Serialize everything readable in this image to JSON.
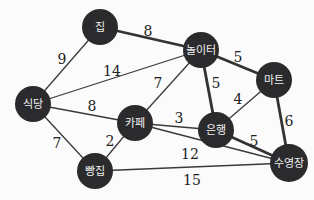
{
  "graph": {
    "nodes": [
      {
        "id": "home",
        "label": "집",
        "x": 100,
        "y": 27,
        "r": 18
      },
      {
        "id": "playground",
        "label": "놀이터",
        "x": 201,
        "y": 50,
        "r": 18
      },
      {
        "id": "mart",
        "label": "마트",
        "x": 274,
        "y": 80,
        "r": 18
      },
      {
        "id": "restaurant",
        "label": "식당",
        "x": 33,
        "y": 104,
        "r": 18
      },
      {
        "id": "cafe",
        "label": "카페",
        "x": 135,
        "y": 123,
        "r": 18
      },
      {
        "id": "bank",
        "label": "은행",
        "x": 216,
        "y": 130,
        "r": 18
      },
      {
        "id": "pool",
        "label": "수영장",
        "x": 289,
        "y": 163,
        "r": 19
      },
      {
        "id": "bakery",
        "label": "빵집",
        "x": 95,
        "y": 171,
        "r": 18
      }
    ],
    "edges": [
      {
        "from": "home",
        "to": "playground",
        "weight": "8",
        "bold": true,
        "lx": 148,
        "ly": 32
      },
      {
        "from": "home",
        "to": "restaurant",
        "weight": "9",
        "bold": false,
        "lx": 62,
        "ly": 60
      },
      {
        "from": "restaurant",
        "to": "playground",
        "weight": "14",
        "bold": false,
        "lx": 112,
        "ly": 72
      },
      {
        "from": "playground",
        "to": "mart",
        "weight": "5",
        "bold": true,
        "lx": 238,
        "ly": 58
      },
      {
        "from": "playground",
        "to": "cafe",
        "weight": "7",
        "bold": false,
        "lx": 158,
        "ly": 84
      },
      {
        "from": "playground",
        "to": "bank",
        "weight": "5",
        "bold": true,
        "lx": 216,
        "ly": 84
      },
      {
        "from": "restaurant",
        "to": "cafe",
        "weight": "8",
        "bold": false,
        "lx": 92,
        "ly": 107
      },
      {
        "from": "mart",
        "to": "bank",
        "weight": "4",
        "bold": false,
        "lx": 238,
        "ly": 100
      },
      {
        "from": "mart",
        "to": "pool",
        "weight": "6",
        "bold": true,
        "lx": 289,
        "ly": 122
      },
      {
        "from": "cafe",
        "to": "bank",
        "weight": "3",
        "bold": false,
        "lx": 179,
        "ly": 119
      },
      {
        "from": "cafe",
        "to": "pool",
        "weight": "12",
        "bold": false,
        "lx": 190,
        "ly": 155
      },
      {
        "from": "bank",
        "to": "pool",
        "weight": "5",
        "bold": true,
        "lx": 254,
        "ly": 142
      },
      {
        "from": "restaurant",
        "to": "bakery",
        "weight": "7",
        "bold": false,
        "lx": 57,
        "ly": 144
      },
      {
        "from": "cafe",
        "to": "bakery",
        "weight": "2",
        "bold": false,
        "lx": 110,
        "ly": 142
      },
      {
        "from": "bakery",
        "to": "pool",
        "weight": "15",
        "bold": false,
        "lx": 192,
        "ly": 181
      }
    ]
  }
}
